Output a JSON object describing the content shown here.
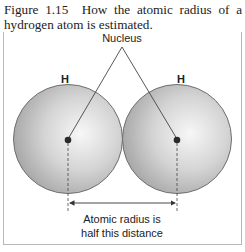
{
  "caption": {
    "figure_number": "Figure 1.15",
    "text": "How the atomic radius of a hydrogen atom is estimated."
  },
  "diagram": {
    "nucleus_label": "Nucleus",
    "atoms": [
      {
        "symbol": "H"
      },
      {
        "symbol": "H"
      }
    ],
    "radius_label_line1": "Atomic radius is",
    "radius_label_line2": "half this distance",
    "colors": {
      "sphere_highlight": "#f7f7f7",
      "sphere_shadow": "#a9a9a9",
      "outline": "#6e6e6e",
      "nucleus": "#2a2a2a",
      "frame": "#b8b8b8"
    }
  }
}
